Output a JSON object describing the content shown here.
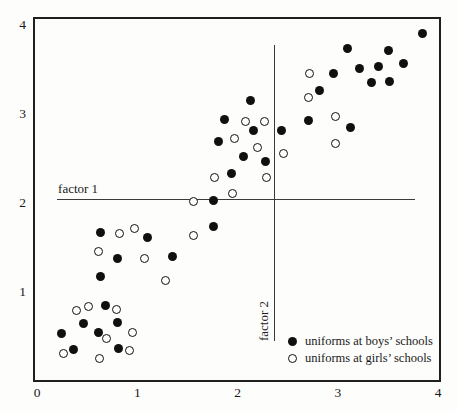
{
  "colors": {
    "background": "#fdfdfc",
    "ink": "#101010",
    "frame": "#1f1f1f",
    "factor_line": "#3a3a3a"
  },
  "chart_data": {
    "type": "scatter",
    "title": "",
    "xlabel": "",
    "ylabel": "",
    "xlim": [
      0,
      4
    ],
    "ylim": [
      0,
      4
    ],
    "grid": false,
    "x_tick_labels": [
      "0",
      "1",
      "2",
      "3",
      "4"
    ],
    "x_tick_values": [
      0,
      1,
      2,
      3,
      4
    ],
    "y_tick_labels": [
      "1",
      "2",
      "3",
      "4"
    ],
    "y_tick_values": [
      1,
      2,
      3,
      4
    ],
    "series": [
      {
        "name": "uniforms at boys’ schools",
        "marker": "filled-circle",
        "color": "#101010",
        "points": [
          [
            3.85,
            3.9
          ],
          [
            3.1,
            3.74
          ],
          [
            3.51,
            3.71
          ],
          [
            3.66,
            3.57
          ],
          [
            3.41,
            3.53
          ],
          [
            3.22,
            3.51
          ],
          [
            2.96,
            3.46
          ],
          [
            3.34,
            3.35
          ],
          [
            3.52,
            3.36
          ],
          [
            2.82,
            3.26
          ],
          [
            2.13,
            3.15
          ],
          [
            1.87,
            2.94
          ],
          [
            2.71,
            2.93
          ],
          [
            3.13,
            2.85
          ],
          [
            2.16,
            2.82
          ],
          [
            2.44,
            2.82
          ],
          [
            1.81,
            2.69
          ],
          [
            2.06,
            2.52
          ],
          [
            2.28,
            2.47
          ],
          [
            1.94,
            2.33
          ],
          [
            1.76,
            2.03
          ],
          [
            1.76,
            1.74
          ],
          [
            0.63,
            1.67
          ],
          [
            1.1,
            1.61
          ],
          [
            1.35,
            1.4
          ],
          [
            0.8,
            1.38
          ],
          [
            0.63,
            1.17
          ],
          [
            0.68,
            0.85
          ],
          [
            0.8,
            0.66
          ],
          [
            0.46,
            0.65
          ],
          [
            0.61,
            0.54
          ],
          [
            0.24,
            0.53
          ],
          [
            0.36,
            0.35
          ],
          [
            0.81,
            0.36
          ]
        ]
      },
      {
        "name": "uniforms at girls’ schools",
        "marker": "open-circle",
        "color": "#101010",
        "points": [
          [
            2.72,
            3.46
          ],
          [
            2.71,
            3.19
          ],
          [
            2.98,
            2.97
          ],
          [
            2.08,
            2.92
          ],
          [
            2.27,
            2.92
          ],
          [
            1.97,
            2.72
          ],
          [
            2.98,
            2.67
          ],
          [
            2.2,
            2.62
          ],
          [
            2.46,
            2.56
          ],
          [
            1.77,
            2.29
          ],
          [
            2.29,
            2.29
          ],
          [
            1.95,
            2.11
          ],
          [
            1.56,
            2.02
          ],
          [
            0.97,
            1.71
          ],
          [
            0.82,
            1.66
          ],
          [
            1.56,
            1.63
          ],
          [
            0.61,
            1.45
          ],
          [
            1.07,
            1.38
          ],
          [
            1.28,
            1.13
          ],
          [
            0.51,
            0.84
          ],
          [
            0.79,
            0.8
          ],
          [
            0.39,
            0.79
          ],
          [
            0.95,
            0.54
          ],
          [
            0.69,
            0.48
          ],
          [
            0.26,
            0.31
          ],
          [
            0.92,
            0.34
          ],
          [
            0.62,
            0.25
          ]
        ]
      }
    ],
    "annotations": {
      "factor1": {
        "label": "factor 1",
        "y": 2.05,
        "x_start": 0.2,
        "x_end": 3.77
      },
      "factor2": {
        "label": "factor 2",
        "x": 2.36,
        "y_start": 0.45,
        "y_end": 3.78
      }
    },
    "legend": {
      "position": "inside-bottom-right",
      "entries": [
        {
          "label": "uniforms at boys’ schools",
          "marker": "filled-circle"
        },
        {
          "label": "uniforms at girls’ schools",
          "marker": "open-circle"
        }
      ]
    }
  }
}
